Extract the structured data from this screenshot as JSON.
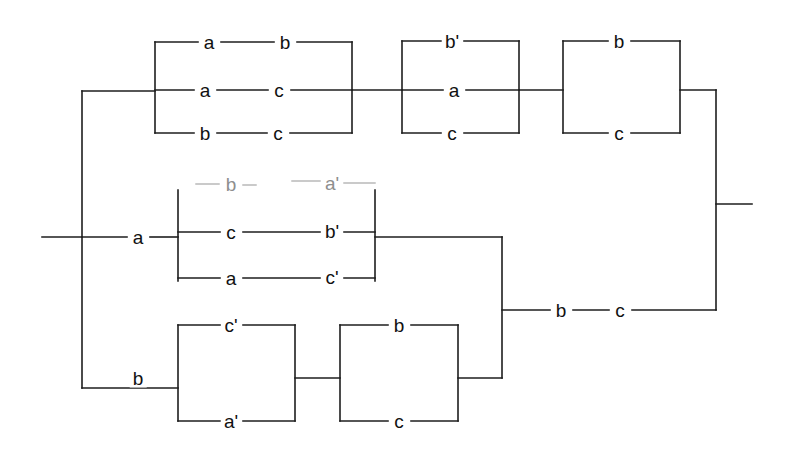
{
  "diagram": {
    "type": "series-parallel-network",
    "canvas": {
      "width": 785,
      "height": 454
    },
    "colors": {
      "wire": "#1e1e1e",
      "wire_faint": "#b9b9b9",
      "background": "#ffffff",
      "label_text": "#111111",
      "label_text_faint": "#8e8e8e"
    },
    "terminals": {
      "input_label": "",
      "output_label": ""
    },
    "groups": [
      {
        "name": "top-branch",
        "blocks": [
          {
            "name": "block-1",
            "rows": [
              {
                "name": "row-1",
                "elements": [
                  "a",
                  "b"
                ]
              },
              {
                "name": "row-2",
                "elements": [
                  "a",
                  "c"
                ]
              },
              {
                "name": "row-3",
                "elements": [
                  "b",
                  "c"
                ]
              }
            ]
          },
          {
            "name": "block-2",
            "rows": [
              {
                "name": "row-1",
                "elements": [
                  "b'"
                ]
              },
              {
                "name": "row-2",
                "elements": [
                  "a"
                ]
              },
              {
                "name": "row-3",
                "elements": [
                  "c"
                ]
              }
            ]
          },
          {
            "name": "block-3",
            "rows": [
              {
                "name": "row-1",
                "elements": [
                  "b"
                ]
              },
              {
                "name": "row-2",
                "elements": [
                  "c"
                ]
              }
            ]
          }
        ]
      },
      {
        "name": "middle-branch",
        "series_label": "a",
        "blocks": [
          {
            "name": "block-4",
            "rows": [
              {
                "name": "row-1",
                "elements": [
                  "b",
                  "a'"
                ],
                "faint": true
              },
              {
                "name": "row-2",
                "elements": [
                  "c",
                  "b'"
                ]
              },
              {
                "name": "row-3",
                "elements": [
                  "a",
                  "c'"
                ]
              }
            ]
          }
        ]
      },
      {
        "name": "bottom-branch",
        "series_label": "b",
        "blocks": [
          {
            "name": "block-5",
            "rows": [
              {
                "name": "row-1",
                "elements": [
                  "c'"
                ]
              },
              {
                "name": "row-2",
                "elements": [
                  "a'"
                ]
              }
            ]
          },
          {
            "name": "block-6",
            "rows": [
              {
                "name": "row-1",
                "elements": [
                  "b"
                ]
              },
              {
                "name": "row-2",
                "elements": [
                  "c"
                ]
              }
            ]
          }
        ]
      },
      {
        "name": "merge-branch",
        "blocks": [
          {
            "name": "block-7",
            "rows": [
              {
                "name": "row-1",
                "elements": [
                  "b",
                  "c"
                ]
              }
            ]
          }
        ]
      }
    ],
    "labels": [
      {
        "id": "l01",
        "text": "a",
        "x": 209,
        "y": 42,
        "faint": false
      },
      {
        "id": "l02",
        "text": "b",
        "x": 285,
        "y": 42,
        "faint": false
      },
      {
        "id": "l03",
        "text": "a",
        "x": 205,
        "y": 90,
        "faint": false
      },
      {
        "id": "l04",
        "text": "c",
        "x": 279,
        "y": 90,
        "faint": false
      },
      {
        "id": "l05",
        "text": "b",
        "x": 205,
        "y": 133,
        "faint": false
      },
      {
        "id": "l06",
        "text": "c",
        "x": 278,
        "y": 133,
        "faint": false
      },
      {
        "id": "l07",
        "text": "b'",
        "x": 452,
        "y": 41,
        "faint": false
      },
      {
        "id": "l08",
        "text": "a",
        "x": 454,
        "y": 90,
        "faint": false
      },
      {
        "id": "l09",
        "text": "c",
        "x": 452,
        "y": 133,
        "faint": false
      },
      {
        "id": "l10",
        "text": "b",
        "x": 619,
        "y": 41,
        "faint": false
      },
      {
        "id": "l11",
        "text": "c",
        "x": 619,
        "y": 133,
        "faint": false
      },
      {
        "id": "l12",
        "text": "a",
        "x": 138,
        "y": 237,
        "faint": false
      },
      {
        "id": "l13",
        "text": "b",
        "x": 231,
        "y": 184,
        "faint": true
      },
      {
        "id": "l14",
        "text": "a'",
        "x": 332,
        "y": 183,
        "faint": true
      },
      {
        "id": "l15",
        "text": "c",
        "x": 231,
        "y": 232,
        "faint": false
      },
      {
        "id": "l16",
        "text": "b'",
        "x": 332,
        "y": 231,
        "faint": false
      },
      {
        "id": "l17",
        "text": "a",
        "x": 231,
        "y": 278,
        "faint": false
      },
      {
        "id": "l18",
        "text": "c'",
        "x": 332,
        "y": 277,
        "faint": false
      },
      {
        "id": "l19",
        "text": "b",
        "x": 138,
        "y": 378,
        "faint": false
      },
      {
        "id": "l20",
        "text": "c'",
        "x": 231,
        "y": 325,
        "faint": false
      },
      {
        "id": "l21",
        "text": "a'",
        "x": 231,
        "y": 421,
        "faint": false
      },
      {
        "id": "l22",
        "text": "b",
        "x": 399,
        "y": 325,
        "faint": false
      },
      {
        "id": "l23",
        "text": "c",
        "x": 399,
        "y": 421,
        "faint": false
      },
      {
        "id": "l24",
        "text": "b",
        "x": 561,
        "y": 310,
        "faint": false
      },
      {
        "id": "l25",
        "text": "c",
        "x": 620,
        "y": 310,
        "faint": false
      }
    ],
    "wires": [
      {
        "id": "w-input",
        "d": "M 42 237 H 82"
      },
      {
        "id": "w-left-bus",
        "d": "M 82 91 V 388"
      },
      {
        "id": "w-left-top",
        "d": "M 82 91 H 155"
      },
      {
        "id": "w-left-bot",
        "d": "M 82 388 H 178"
      },
      {
        "id": "w-b1-bus",
        "d": "M 155 42 V 133"
      },
      {
        "id": "w-b1-r1a",
        "d": "M 155 42 H 198"
      },
      {
        "id": "w-b1-r1b",
        "d": "M 221 42 H 274"
      },
      {
        "id": "w-b1-r1c",
        "d": "M 297 42 H 352"
      },
      {
        "id": "w-b1-r2a",
        "d": "M 155 90 H 194"
      },
      {
        "id": "w-b1-r2b",
        "d": "M 217 90 H 268"
      },
      {
        "id": "w-b1-r2c",
        "d": "M 291 90 H 352"
      },
      {
        "id": "w-b1-r3a",
        "d": "M 155 133 H 194"
      },
      {
        "id": "w-b1-r3b",
        "d": "M 217 133 H 267"
      },
      {
        "id": "w-b1-r3c",
        "d": "M 290 133 H 352"
      },
      {
        "id": "w-b1-rbus",
        "d": "M 352 42 V 133"
      },
      {
        "id": "w-b1-b2-link",
        "d": "M 352 90 H 402"
      },
      {
        "id": "w-b2-bus",
        "d": "M 402 41 V 133"
      },
      {
        "id": "w-b2-r1a",
        "d": "M 402 41 H 441"
      },
      {
        "id": "w-b2-r1b",
        "d": "M 464 41 H 519"
      },
      {
        "id": "w-b2-r2a",
        "d": "M 402 90 H 443"
      },
      {
        "id": "w-b2-r2b",
        "d": "M 466 90 H 519"
      },
      {
        "id": "w-b2-r3a",
        "d": "M 402 133 H 441"
      },
      {
        "id": "w-b2-r3b",
        "d": "M 464 133 H 519"
      },
      {
        "id": "w-b2-rbus",
        "d": "M 519 41 V 133"
      },
      {
        "id": "w-b2-b3-link",
        "d": "M 519 90 H 563"
      },
      {
        "id": "w-b3-bus",
        "d": "M 563 41 V 133"
      },
      {
        "id": "w-b3-r1a",
        "d": "M 563 41 H 608"
      },
      {
        "id": "w-b3-r1b",
        "d": "M 631 41 H 680"
      },
      {
        "id": "w-b3-r2a",
        "d": "M 563 133 H 608"
      },
      {
        "id": "w-b3-r2b",
        "d": "M 631 133 H 680"
      },
      {
        "id": "w-b3-rbus",
        "d": "M 680 41 V 133"
      },
      {
        "id": "w-b3-out",
        "d": "M 680 90 H 716"
      },
      {
        "id": "w-mid-in",
        "d": "M 82 237 H 127"
      },
      {
        "id": "w-mid-in2",
        "d": "M 150 237 H 178"
      },
      {
        "id": "w-b4-bus",
        "d": "M 178 190 V 281"
      },
      {
        "id": "w-b4-r2a",
        "d": "M 178 232 H 220"
      },
      {
        "id": "w-b4-r2b",
        "d": "M 243 232 H 320"
      },
      {
        "id": "w-b4-r2c",
        "d": "M 344 232 H 375"
      },
      {
        "id": "w-b4-r3a",
        "d": "M 178 278 H 220"
      },
      {
        "id": "w-b4-r3b",
        "d": "M 243 278 H 320"
      },
      {
        "id": "w-b4-r3c",
        "d": "M 344 278 H 375"
      },
      {
        "id": "w-b4-rbus",
        "d": "M 375 190 V 281"
      },
      {
        "id": "w-b4-out",
        "d": "M 375 237 H 502"
      },
      {
        "id": "w-b5-bus",
        "d": "M 178 325 V 421"
      },
      {
        "id": "w-b5-r1a",
        "d": "M 178 325 H 220"
      },
      {
        "id": "w-b5-r1b",
        "d": "M 243 325 H 295"
      },
      {
        "id": "w-b5-r2a",
        "d": "M 178 421 H 220"
      },
      {
        "id": "w-b5-r2b",
        "d": "M 243 421 H 295"
      },
      {
        "id": "w-b5-rbus",
        "d": "M 295 325 V 421"
      },
      {
        "id": "w-b5-b6-link",
        "d": "M 295 378 H 340"
      },
      {
        "id": "w-b6-bus",
        "d": "M 340 325 V 421"
      },
      {
        "id": "w-b6-r1a",
        "d": "M 340 325 H 388"
      },
      {
        "id": "w-b6-r1b",
        "d": "M 411 325 H 458"
      },
      {
        "id": "w-b6-r2a",
        "d": "M 340 421 H 388"
      },
      {
        "id": "w-b6-r2b",
        "d": "M 411 421 H 458"
      },
      {
        "id": "w-b6-rbus",
        "d": "M 458 325 V 421"
      },
      {
        "id": "w-b6-out",
        "d": "M 458 378 H 502"
      },
      {
        "id": "w-merge-bus",
        "d": "M 502 237 V 378"
      },
      {
        "id": "w-merge-r1a",
        "d": "M 502 310 H 550"
      },
      {
        "id": "w-merge-r1b",
        "d": "M 573 310 H 609"
      },
      {
        "id": "w-merge-r1c",
        "d": "M 632 310 H 716"
      },
      {
        "id": "w-right-bus",
        "d": "M 716 90 V 310"
      },
      {
        "id": "w-output",
        "d": "M 716 204 H 752"
      }
    ],
    "wires_faint": [
      {
        "id": "wf-b4-r1a",
        "d": "M 196 184 H 219"
      },
      {
        "id": "wf-b4-r1b",
        "d": "M 243 185 H 256"
      },
      {
        "id": "wf-b4-r1c",
        "d": "M 292 181 H 320"
      },
      {
        "id": "wf-b4-r1d",
        "d": "M 344 183 H 375"
      }
    ]
  }
}
